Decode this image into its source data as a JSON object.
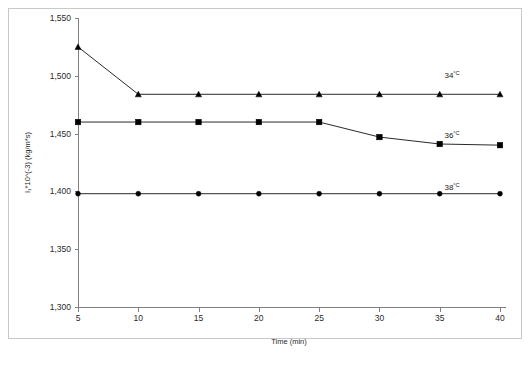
{
  "chart_data": {
    "type": "line",
    "title": "",
    "xlabel": "Time (min)",
    "ylabel": "I₁*10^(-3) (kg/m*s)",
    "x": [
      5,
      10,
      15,
      20,
      25,
      30,
      35,
      40
    ],
    "xticklabels": [
      "5",
      "10",
      "15",
      "20",
      "25",
      "30",
      "35",
      "40"
    ],
    "yticks": [
      1300,
      1350,
      1400,
      1450,
      1500,
      1550
    ],
    "yticklabels": [
      "1,300",
      "1,350",
      "1,400",
      "1,450",
      "1,500",
      "1,550"
    ],
    "xlim": [
      5,
      40
    ],
    "ylim": [
      1300,
      1550
    ],
    "grid": false,
    "legend_position": "inline-right",
    "series": [
      {
        "name": "34°C",
        "label_number": "34",
        "label_unit": "°C",
        "marker": "triangle",
        "color": "#000000",
        "values": [
          1525,
          1484,
          1484,
          1484,
          1484,
          1484,
          1484,
          1484
        ]
      },
      {
        "name": "36°C",
        "label_number": "36",
        "label_unit": "°C",
        "marker": "square",
        "color": "#000000",
        "values": [
          1460,
          1460,
          1460,
          1460,
          1460,
          1447,
          1441,
          1440
        ]
      },
      {
        "name": "38°C",
        "label_number": "38",
        "label_unit": "°C",
        "marker": "circle",
        "color": "#000000",
        "values": [
          1398,
          1398,
          1398,
          1398,
          1398,
          1398,
          1398,
          1398
        ]
      }
    ],
    "series_label_positions": [
      {
        "name": "34°C",
        "x_px": 452,
        "y_px": 78
      },
      {
        "name": "36°C",
        "x_px": 452,
        "y_px": 138
      },
      {
        "name": "38°C",
        "x_px": 452,
        "y_px": 190
      }
    ]
  },
  "axes_geometry": {
    "plot_left": 78,
    "plot_right": 500,
    "plot_top": 18,
    "plot_bottom": 307
  }
}
